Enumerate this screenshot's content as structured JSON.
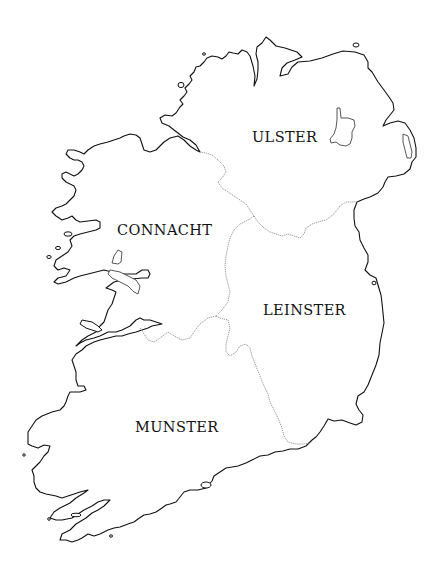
{
  "map": {
    "subject": "Ireland",
    "style": "outline",
    "colors": {
      "background": "#ffffff",
      "coastline": "#111111",
      "province_border": "#8a8a8a",
      "label_text": "#111111"
    },
    "provinces": [
      {
        "name": "ULSTER",
        "label_x": 252,
        "label_y": 142
      },
      {
        "name": "CONNACHT",
        "label_x": 117,
        "label_y": 235
      },
      {
        "name": "LEINSTER",
        "label_x": 263,
        "label_y": 315
      },
      {
        "name": "MUNSTER",
        "label_x": 135,
        "label_y": 432
      }
    ]
  }
}
